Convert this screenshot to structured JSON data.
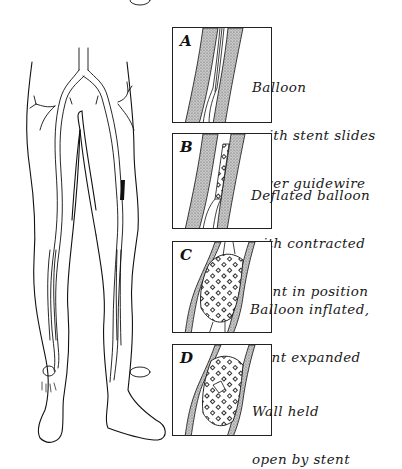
{
  "figure": {
    "panels": [
      {
        "letter": "A",
        "caption_lines": [
          "Balloon",
          " with stent slides",
          " over guidewire"
        ],
        "stage": "balloon-with-stent-on-guidewire"
      },
      {
        "letter": "B",
        "caption_lines": [
          "Deflated balloon",
          "with contracted",
          "stent in position"
        ],
        "stage": "deflated-balloon-contracted-stent"
      },
      {
        "letter": "C",
        "caption_lines": [
          "Balloon inflated,",
          "stent expanded"
        ],
        "stage": "balloon-inflated-stent-expanded"
      },
      {
        "letter": "D",
        "caption_lines": [
          "Wall held",
          "open by stent"
        ],
        "stage": "wall-held-open-by-stent"
      }
    ],
    "illustration": "legs-arterial-anatomy",
    "colors": {
      "ink": "#1a1a1a",
      "vessel_wall": "#9a9a9a",
      "background": "#ffffff"
    }
  }
}
